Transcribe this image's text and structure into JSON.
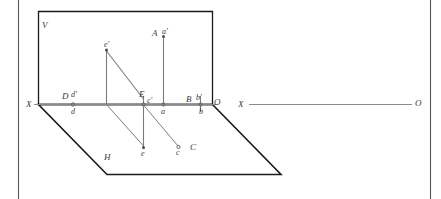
{
  "figure": {
    "type": "descriptive-geometry-diagram",
    "colors": {
      "plane_outline": "#1a1a1a",
      "projection_line": "#6e6e6e",
      "axis_line": "#8a8a8a",
      "frame_border": "#555555",
      "label_text": "#3a3a3a",
      "background": "#ffffff"
    },
    "planes": {
      "vertical_label": "V",
      "horizontal_label": "H"
    },
    "axis": {
      "left_label": "X",
      "origin_label": "O",
      "second_axis_left_label": "X",
      "second_axis_right_label": "O"
    },
    "points": [
      {
        "id": "A",
        "label": "A",
        "kind": "space-point-name"
      },
      {
        "id": "ap",
        "label": "a'",
        "kind": "frontal-projection"
      },
      {
        "id": "a",
        "label": "a",
        "kind": "horizontal-projection"
      },
      {
        "id": "B",
        "label": "B",
        "kind": "space-point-name"
      },
      {
        "id": "bp",
        "label": "b'",
        "kind": "frontal-projection"
      },
      {
        "id": "b",
        "label": "b",
        "kind": "horizontal-projection"
      },
      {
        "id": "C",
        "label": "C",
        "kind": "space-point-name"
      },
      {
        "id": "cp",
        "label": "c'",
        "kind": "frontal-projection"
      },
      {
        "id": "c",
        "label": "c",
        "kind": "horizontal-projection"
      },
      {
        "id": "D",
        "label": "D",
        "kind": "space-point-name"
      },
      {
        "id": "dp",
        "label": "d'",
        "kind": "frontal-projection"
      },
      {
        "id": "d",
        "label": "d",
        "kind": "horizontal-projection"
      },
      {
        "id": "E",
        "label": "E",
        "kind": "space-point-name"
      },
      {
        "id": "ep",
        "label": "e'",
        "kind": "frontal-projection"
      },
      {
        "id": "e",
        "label": "e",
        "kind": "horizontal-projection"
      }
    ]
  }
}
